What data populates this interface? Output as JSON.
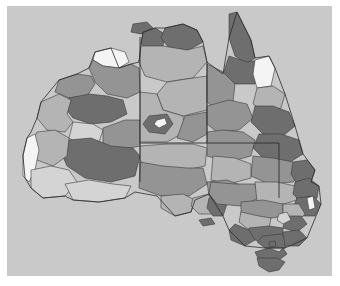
{
  "figure": {
    "kind": "map",
    "panel": {
      "background_color": "#c9c9c9",
      "outer_background_color": "#ffffff",
      "left": 7,
      "top": 6,
      "width": 325,
      "height": 270
    },
    "border_color": "#3a3a3a",
    "state_border_color": "#2e2e2e"
  },
  "legend": {
    "present": false,
    "scale_type": "grayscale",
    "classes": [
      {
        "name": "class-1-lowest",
        "color": "#f4f4f4",
        "label": ""
      },
      {
        "name": "class-2-low",
        "color": "#d4d4d4",
        "label": ""
      },
      {
        "name": "class-3-mid",
        "color": "#b4b4b4",
        "label": ""
      },
      {
        "name": "class-4-high",
        "color": "#949494",
        "label": ""
      },
      {
        "name": "class-5-highest",
        "color": "#6e6e6e",
        "label": ""
      }
    ]
  },
  "axes": {
    "visible": false,
    "ticks": [],
    "labels": []
  },
  "annotations": [],
  "chart_data": {
    "type": "map",
    "title": "",
    "xlabel": "",
    "ylabel": "",
    "projection": "equirectangular",
    "colormap": "grays",
    "grid": false,
    "legend_position": "none",
    "region_count": 96,
    "value_classes": [
      "#f4f4f4",
      "#d4d4d4",
      "#b4b4b4",
      "#949494",
      "#6e6e6e"
    ],
    "states": [
      "Western Australia",
      "Northern Territory",
      "South Australia",
      "Queensland",
      "New South Wales",
      "Victoria",
      "Tasmania",
      "Australian Capital Territory"
    ],
    "state_border_segments": [
      {
        "name": "wa-nt-sa-meridian",
        "x1": 133,
        "y1": 30,
        "x2": 133,
        "y2": 175
      },
      {
        "name": "nt-sa-parallel",
        "x1": 133,
        "y1": 137,
        "x2": 272,
        "y2": 137
      },
      {
        "name": "nt-qld-meridian",
        "x1": 200,
        "y1": 30,
        "x2": 200,
        "y2": 137
      },
      {
        "name": "sa-nsw-meridian",
        "x1": 272,
        "y1": 137,
        "x2": 272,
        "y2": 192
      }
    ],
    "regions": [
      {
        "id": "r01",
        "state": "Western Australia",
        "class": 4,
        "color": "#949494"
      },
      {
        "id": "r02",
        "state": "Western Australia",
        "class": 1,
        "color": "#f4f4f4"
      },
      {
        "id": "r03",
        "state": "Western Australia",
        "class": 5,
        "color": "#6e6e6e"
      },
      {
        "id": "r04",
        "state": "Western Australia",
        "class": 3,
        "color": "#b4b4b4"
      },
      {
        "id": "r05",
        "state": "Western Australia",
        "class": 2,
        "color": "#d4d4d4"
      },
      {
        "id": "r06",
        "state": "Northern Territory",
        "class": 5,
        "color": "#6e6e6e"
      },
      {
        "id": "r07",
        "state": "Northern Territory",
        "class": 3,
        "color": "#b4b4b4"
      },
      {
        "id": "r08",
        "state": "Queensland",
        "class": 5,
        "color": "#6e6e6e"
      },
      {
        "id": "r09",
        "state": "Queensland",
        "class": 1,
        "color": "#f4f4f4"
      },
      {
        "id": "r10",
        "state": "Queensland",
        "class": 4,
        "color": "#949494"
      },
      {
        "id": "r11",
        "state": "South Australia",
        "class": 3,
        "color": "#b4b4b4"
      },
      {
        "id": "r12",
        "state": "New South Wales",
        "class": 5,
        "color": "#6e6e6e"
      },
      {
        "id": "r13",
        "state": "Victoria",
        "class": 5,
        "color": "#6e6e6e"
      },
      {
        "id": "r14",
        "state": "Tasmania",
        "class": 5,
        "color": "#6e6e6e"
      }
    ]
  }
}
